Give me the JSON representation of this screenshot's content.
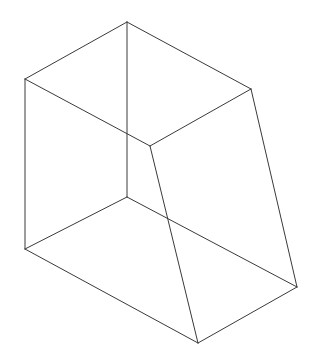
{
  "document": {
    "title": "Wireframe Line Drawing",
    "kind": "geometric-solid-wireframe",
    "description": "Black outline line drawing of a truncated rectangular prism / wedge-like polyhedron shown in an isometric-style projection on a plain white background. No text, labels, axes, or UI controls are present.",
    "background_color": "#ffffff",
    "line_color": "#3a3a3a",
    "line_width_px": 1,
    "canvas": {
      "width": 319,
      "height": 357
    }
  },
  "figure": {
    "name": "truncated-prism-wireframe",
    "vertices": {
      "top_apex": {
        "x": 127,
        "y": 22
      },
      "top_left": {
        "x": 25,
        "y": 79
      },
      "top_right": {
        "x": 251,
        "y": 89
      },
      "inner_junction": {
        "x": 150,
        "y": 146
      },
      "front_bottom": {
        "x": 127,
        "y": 197
      },
      "bottom_left": {
        "x": 25,
        "y": 249
      },
      "bottom_right": {
        "x": 297,
        "y": 287
      },
      "bottom_apex": {
        "x": 198,
        "y": 343
      }
    },
    "edges": [
      {
        "name": "top-left-roof-edge",
        "path": "M 25 79 L 127 22"
      },
      {
        "name": "top-right-roof-edge",
        "path": "M 127 22 L 251 89"
      },
      {
        "name": "front-vertical-center-edge",
        "path": "M 127 22 L 127 197"
      },
      {
        "name": "top-face-left-diagonal",
        "path": "M 25 79 L 150 146"
      },
      {
        "name": "top-face-right-diagonal",
        "path": "M 150 146 L 251 89"
      },
      {
        "name": "left-vertical-edge",
        "path": "M 25 79 L 25 249"
      },
      {
        "name": "bottom-left-front-edge",
        "path": "M 25 249 L 127 197"
      },
      {
        "name": "bottom-left-to-bottom-apex-edge",
        "path": "M 25 249 L 198 343"
      },
      {
        "name": "slanted-inner-edge",
        "path": "M 150 146 L 198 343"
      },
      {
        "name": "bottom-front-right-edge",
        "path": "M 127 197 L 297 287"
      },
      {
        "name": "right-slanted-side-edge",
        "path": "M 251 89 L 297 287"
      },
      {
        "name": "bottom-right-base-edge",
        "path": "M 198 343 L 297 287"
      }
    ]
  },
  "chart_data": {
    "type": "table",
    "xlabel": "",
    "ylabel": "",
    "columns": [
      "Edge",
      "From (x,y)",
      "To (x,y)"
    ],
    "rows": [
      [
        "top-left-roof-edge",
        "(25, 79)",
        "(127, 22)"
      ],
      [
        "top-right-roof-edge",
        "(127, 22)",
        "(251, 89)"
      ],
      [
        "front-vertical-center-edge",
        "(127, 22)",
        "(127, 197)"
      ],
      [
        "top-face-left-diagonal",
        "(25, 79)",
        "(150, 146)"
      ],
      [
        "top-face-right-diagonal",
        "(150, 146)",
        "(251, 89)"
      ],
      [
        "left-vertical-edge",
        "(25, 79)",
        "(25, 249)"
      ],
      [
        "bottom-left-front-edge",
        "(25, 249)",
        "(127, 197)"
      ],
      [
        "bottom-left-to-bottom-apex-edge",
        "(25, 249)",
        "(198, 343)"
      ],
      [
        "slanted-inner-edge",
        "(150, 146)",
        "(198, 343)"
      ],
      [
        "bottom-front-right-edge",
        "(127, 197)",
        "(297, 287)"
      ],
      [
        "right-slanted-side-edge",
        "(251, 89)",
        "(297, 287)"
      ],
      [
        "bottom-right-base-edge",
        "(198, 343)",
        "(297, 287)"
      ]
    ]
  }
}
